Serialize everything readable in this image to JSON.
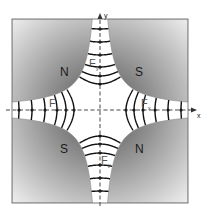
{
  "diagram": {
    "axes": {
      "x_label": "x",
      "y_label": "y"
    },
    "poles": [
      {
        "position": "top-left",
        "label": "N"
      },
      {
        "position": "top-right",
        "label": "S"
      },
      {
        "position": "bottom-left",
        "label": "S"
      },
      {
        "position": "bottom-right",
        "label": "N"
      }
    ],
    "forces": [
      {
        "position": "top",
        "label": "F",
        "subscript": "y"
      },
      {
        "position": "left",
        "label": "F",
        "subscript": "x"
      },
      {
        "position": "right",
        "label": "F",
        "subscript": "x"
      },
      {
        "position": "bottom",
        "label": "F",
        "subscript": "y"
      }
    ],
    "colors": {
      "pole_dark": "#6e6e6e",
      "pole_light": "#f2f2f2",
      "field_line": "#111111",
      "axis": "#333333"
    }
  }
}
